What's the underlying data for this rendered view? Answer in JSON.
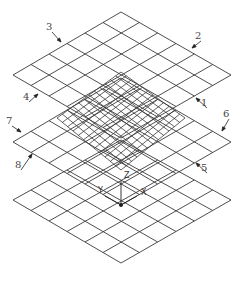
{
  "figure": {
    "type": "isometric stacked grid layers",
    "line_color": "#3a3a3a",
    "background": "#ffffff"
  },
  "layers": [
    {
      "name": "top-layer",
      "top": [
        121,
        12
      ],
      "left": [
        13,
        75
      ],
      "right": [
        231,
        75
      ],
      "bottom": [
        121,
        138
      ],
      "divisions": 6
    },
    {
      "name": "middle-layer",
      "top": [
        121,
        78
      ],
      "left": [
        13,
        142
      ],
      "right": [
        231,
        142
      ],
      "bottom": [
        121,
        205
      ],
      "divisions": 6
    },
    {
      "name": "bottom-layer",
      "top": [
        121,
        140
      ],
      "left": [
        13,
        200
      ],
      "right": [
        231,
        200
      ],
      "bottom": [
        121,
        263
      ],
      "divisions": 6
    }
  ],
  "fine_mesh": {
    "top": [
      121,
      72
    ],
    "left": [
      57,
      118
    ],
    "right": [
      185,
      118
    ],
    "bottom": [
      121,
      170
    ],
    "divisions": 12
  },
  "axes": {
    "origin": [
      121,
      205
    ],
    "labels": {
      "x": "X",
      "y": "Y",
      "z": "Z"
    }
  },
  "callouts": [
    {
      "id": "1",
      "text": "1",
      "label_pos": [
        204,
        103
      ],
      "arrow_to": [
        196,
        98
      ]
    },
    {
      "id": "2",
      "text": "2",
      "label_pos": [
        198,
        36
      ],
      "arrow_to": [
        192,
        48
      ]
    },
    {
      "id": "3",
      "text": "3",
      "label_pos": [
        49,
        27
      ],
      "arrow_to": [
        61,
        42
      ]
    },
    {
      "id": "4",
      "text": "4",
      "label_pos": [
        26,
        97
      ],
      "arrow_to": [
        38,
        94
      ]
    },
    {
      "id": "5",
      "text": "5",
      "label_pos": [
        204,
        168
      ],
      "arrow_to": [
        196,
        163
      ]
    },
    {
      "id": "6",
      "text": "6",
      "label_pos": [
        226,
        114
      ],
      "arrow_to": [
        222,
        131
      ]
    },
    {
      "id": "7",
      "text": "7",
      "label_pos": [
        9,
        121
      ],
      "arrow_to": [
        21,
        132
      ]
    },
    {
      "id": "8",
      "text": "8",
      "label_pos": [
        18,
        165
      ],
      "arrow_to": [
        32,
        154
      ]
    }
  ]
}
